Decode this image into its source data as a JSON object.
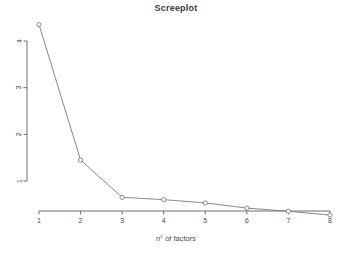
{
  "chart": {
    "title": "Screeplot",
    "xlabel": "n° of factors",
    "ylabel": ""
  },
  "chart_data": {
    "type": "line",
    "title": "Screeplot",
    "xlabel": "n° of factors",
    "ylabel": "",
    "x": [
      1,
      2,
      3,
      4,
      5,
      6,
      7,
      8
    ],
    "categories": [
      "1",
      "2",
      "3",
      "4",
      "5",
      "6",
      "7",
      "8"
    ],
    "values": [
      4.35,
      1.45,
      0.65,
      0.6,
      0.53,
      0.42,
      0.35,
      0.27
    ],
    "series": [
      {
        "name": "eigenvalue",
        "values": [
          4.35,
          1.45,
          0.65,
          0.6,
          0.53,
          0.42,
          0.35,
          0.27
        ]
      }
    ],
    "xlim": [
      1,
      8
    ],
    "ylim": [
      0.2,
      4.45
    ],
    "xticks": [
      1,
      2,
      3,
      4,
      5,
      6,
      7,
      8
    ],
    "xticklabels": [
      "1",
      "2",
      "3",
      "4",
      "5",
      "6",
      "7",
      "8"
    ],
    "yticks": [
      1,
      2,
      3,
      4
    ],
    "yticklabels": [
      "1",
      "2",
      "3",
      "4"
    ],
    "grid": false,
    "legend": false,
    "marker": "open-circle",
    "line_color": "#7a7a7a",
    "marker_color": "#7a7a7a",
    "axis_color": "#6f6f6f",
    "ytick_label_rotation": 90
  }
}
